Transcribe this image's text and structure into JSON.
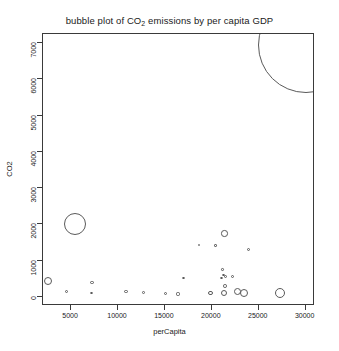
{
  "chart_data": {
    "type": "scatter",
    "title": "bubble plot of CO2 emissions by per capita GDP",
    "title_html": "bubble plot of CO<sub>2</sub> emissions by per capita GDP",
    "xlabel": "perCapita",
    "ylabel": "CO2",
    "xlim": [
      2000,
      31000
    ],
    "ylim": [
      -250,
      7250
    ],
    "xticks": [
      5000,
      10000,
      15000,
      20000,
      25000,
      30000
    ],
    "yticks": [
      0,
      1000,
      2000,
      3000,
      4000,
      5000,
      6000,
      7000
    ],
    "xtick_labels": [
      "5000",
      "10000",
      "15000",
      "20000",
      "25000",
      "30000"
    ],
    "ytick_labels": [
      "0",
      "1000",
      "2000",
      "3000",
      "4000",
      "5000",
      "6000",
      "7000"
    ],
    "grid": false,
    "legend": null,
    "size_encoding": "bubble radius proportional to magnitude",
    "marker_style": "open circle",
    "marker_color": "#5a5a5a",
    "points": [
      {
        "x": 30000,
        "y": 6950,
        "r": 48
      },
      {
        "x": 5400,
        "y": 2010,
        "r": 11
      },
      {
        "x": 2550,
        "y": 430,
        "r": 4.0
      },
      {
        "x": 21350,
        "y": 1750,
        "r": 3.2
      },
      {
        "x": 23950,
        "y": 1300,
        "r": 1.6
      },
      {
        "x": 27250,
        "y": 120,
        "r": 5.0
      },
      {
        "x": 23450,
        "y": 110,
        "r": 4.2
      },
      {
        "x": 22700,
        "y": 140,
        "r": 3.6
      },
      {
        "x": 21300,
        "y": 120,
        "r": 3.0
      },
      {
        "x": 19900,
        "y": 110,
        "r": 2.4
      },
      {
        "x": 21400,
        "y": 300,
        "r": 1.8
      },
      {
        "x": 21050,
        "y": 520,
        "r": 1.4
      },
      {
        "x": 21250,
        "y": 610,
        "r": 1.3
      },
      {
        "x": 21500,
        "y": 560,
        "r": 1.6
      },
      {
        "x": 22200,
        "y": 560,
        "r": 1.5
      },
      {
        "x": 21150,
        "y": 760,
        "r": 1.2
      },
      {
        "x": 20400,
        "y": 1420,
        "r": 1.1
      },
      {
        "x": 18650,
        "y": 1430,
        "r": 1.0
      },
      {
        "x": 7200,
        "y": 400,
        "r": 1.8
      },
      {
        "x": 7150,
        "y": 110,
        "r": 1.3
      },
      {
        "x": 4500,
        "y": 150,
        "r": 1.5
      },
      {
        "x": 10850,
        "y": 140,
        "r": 1.6
      },
      {
        "x": 12750,
        "y": 130,
        "r": 1.4
      },
      {
        "x": 15050,
        "y": 90,
        "r": 1.7
      },
      {
        "x": 16400,
        "y": 80,
        "r": 1.6
      },
      {
        "x": 17000,
        "y": 520,
        "r": 1.2
      }
    ]
  },
  "axes": {
    "x_title": "perCapita",
    "y_title": "CO2"
  }
}
